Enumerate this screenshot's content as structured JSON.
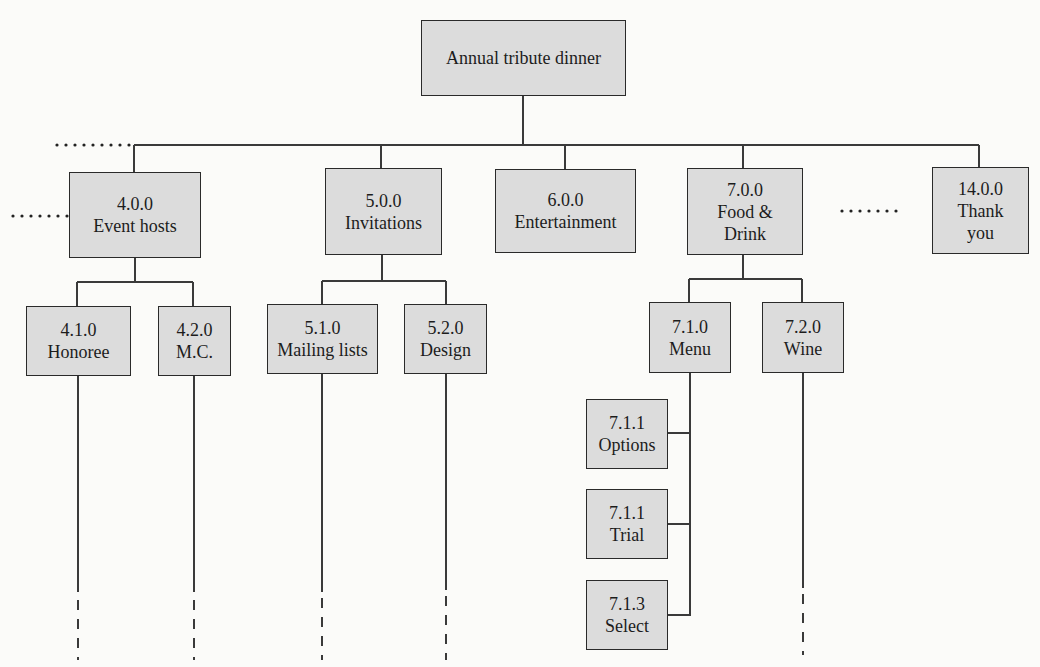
{
  "root": {
    "label": "Annual tribute dinner"
  },
  "level1": [
    {
      "code": "4.0.0",
      "label": "Event hosts"
    },
    {
      "code": "5.0.0",
      "label": "Invitations"
    },
    {
      "code": "6.0.0",
      "label": "Entertainment"
    },
    {
      "code": "7.0.0",
      "label": "Food &",
      "label2": "Drink"
    },
    {
      "code": "14.0.0",
      "label": "Thank",
      "label2": "you"
    }
  ],
  "level2": [
    {
      "code": "4.1.0",
      "label": "Honoree"
    },
    {
      "code": "4.2.0",
      "label": "M.C."
    },
    {
      "code": "5.1.0",
      "label": "Mailing lists"
    },
    {
      "code": "5.2.0",
      "label": "Design"
    },
    {
      "code": "7.1.0",
      "label": "Menu"
    },
    {
      "code": "7.2.0",
      "label": "Wine"
    }
  ],
  "level3": [
    {
      "code": "7.1.1",
      "label": "Options"
    },
    {
      "code": "7.1.1",
      "label": "Trial"
    },
    {
      "code": "7.1.3",
      "label": "Select"
    }
  ],
  "colors": {
    "box_fill": "#dcdcdc",
    "line": "#2a2a2a",
    "background": "#fbfbf9"
  }
}
